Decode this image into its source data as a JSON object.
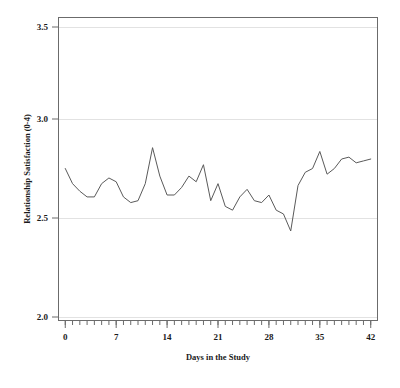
{
  "figure": {
    "background_color": "#ffffff",
    "line_color": "#5a5a5a",
    "grid_color": "#e2e2e2",
    "axis_color": "#6b6b6b"
  },
  "chart_data": {
    "type": "line",
    "title": "",
    "xlabel": "Days in the Study",
    "ylabel": "Relationship Satisfaction (0-4)",
    "xlim": [
      -1,
      43
    ],
    "ylim": [
      2.0,
      3.6
    ],
    "grid": true,
    "legend": null,
    "xticks": [
      0,
      7,
      14,
      21,
      28,
      35,
      42
    ],
    "xtick_labels": [
      "0",
      "7",
      "14",
      "21",
      "28",
      "35",
      "42"
    ],
    "yticks": [
      2.0,
      2.5,
      3.0,
      3.5
    ],
    "ytick_labels": [
      "2.0",
      "2.5",
      "3.0",
      "3.5"
    ],
    "minor_xtick_interval": 1,
    "series": [
      {
        "name": "Relationship Satisfaction",
        "x": [
          0,
          1,
          2,
          3,
          4,
          5,
          6,
          7,
          8,
          9,
          10,
          11,
          12,
          13,
          14,
          15,
          16,
          17,
          18,
          19,
          20,
          21,
          22,
          23,
          24,
          25,
          26,
          27,
          28,
          29,
          30,
          31,
          32,
          33,
          34,
          35,
          36,
          37,
          38,
          39,
          40,
          41,
          42
        ],
        "values": [
          2.8,
          2.72,
          2.68,
          2.65,
          2.65,
          2.72,
          2.75,
          2.73,
          2.65,
          2.62,
          2.63,
          2.72,
          2.91,
          2.76,
          2.66,
          2.66,
          2.7,
          2.76,
          2.73,
          2.82,
          2.63,
          2.72,
          2.6,
          2.58,
          2.65,
          2.69,
          2.63,
          2.62,
          2.66,
          2.58,
          2.56,
          2.47,
          2.71,
          2.78,
          2.8,
          2.89,
          2.77,
          2.8,
          2.85,
          2.86,
          2.83,
          2.84,
          2.85
        ]
      }
    ]
  },
  "axes": {
    "x_title": "Days in the Study",
    "y_title": "Relationship Satisfaction (0-4)"
  }
}
